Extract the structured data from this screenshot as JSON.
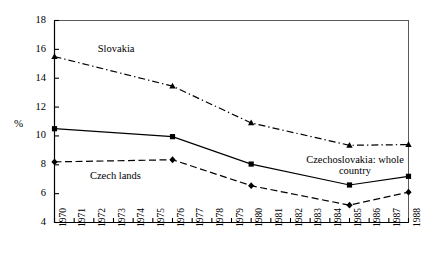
{
  "chart_data": {
    "type": "line",
    "title": "",
    "subtitle": "",
    "xlabel": "",
    "ylabel": "%",
    "ylim": [
      4,
      18
    ],
    "ytick_labels": [
      "18",
      "16",
      "14",
      "12",
      "10",
      "8",
      "6",
      "4"
    ],
    "ytick_values": [
      18,
      16,
      14,
      12,
      10,
      8,
      6,
      4
    ],
    "xtick_labels": [
      "1970",
      "1971",
      "1972",
      "1973",
      "1974",
      "1975",
      "1976",
      "1977",
      "1978",
      "1979",
      "1980",
      "1981",
      "1982",
      "1983",
      "1984",
      "1985",
      "1986",
      "1987",
      "1988"
    ],
    "x": [
      1970,
      1976,
      1980,
      1985,
      1988
    ],
    "grid": false,
    "legend_position": "inline-annotations",
    "series": [
      {
        "name": "Slovakia",
        "x": [
          1970,
          1976,
          1980,
          1985,
          1988
        ],
        "values": [
          15.5,
          13.45,
          10.9,
          9.35,
          9.4
        ],
        "marker": "triangle",
        "linestyle": "dash-dot",
        "color": "#000000"
      },
      {
        "name": "Czechoslovakia: whole country",
        "x": [
          1970,
          1976,
          1980,
          1985,
          1988
        ],
        "values": [
          10.5,
          9.95,
          8.05,
          6.6,
          7.2
        ],
        "marker": "square",
        "linestyle": "solid",
        "color": "#000000"
      },
      {
        "name": "Czech lands",
        "x": [
          1970,
          1976,
          1980,
          1985,
          1988
        ],
        "values": [
          8.2,
          8.35,
          6.55,
          5.2,
          6.1
        ],
        "marker": "diamond",
        "linestyle": "dashed",
        "color": "#000000"
      }
    ],
    "annotations": [
      {
        "text": "Slovakia",
        "x": 1972.2,
        "y": 16.0
      },
      {
        "text": "Czech lands",
        "x": 1971.8,
        "y": 7.25
      },
      {
        "text": "Czechoslovakia: whole",
        "x": 1983.0,
        "y": 8.35
      },
      {
        "text": "country",
        "x": 1984.4,
        "y": 7.75
      }
    ]
  },
  "labels": {
    "ylabel": "%",
    "slovakia": "Slovakia",
    "czech_lands": "Czech lands",
    "czechoslovakia_line1": "Czechoslovakia: whole",
    "czechoslovakia_line2": "country"
  },
  "colors": {
    "line": "#000000",
    "axis": "#000000",
    "background": "#ffffff"
  }
}
